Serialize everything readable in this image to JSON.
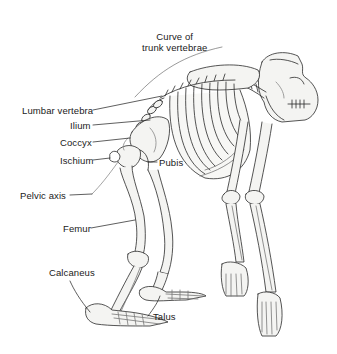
{
  "figure": {
    "colors": {
      "background": "#ffffff",
      "line": "#2a2a2a",
      "bone_fill": "#f4f4f2",
      "shade": "#9a9a9a"
    }
  },
  "labels": {
    "curve": {
      "line1": "Curve of",
      "line2": "trunk vertebrae"
    },
    "lumbar_vertebra": "Lumbar vertebra",
    "ilium": "Ilium",
    "coccyx": "Coccyx",
    "ischium": "Ischium",
    "pubis": "Pubis",
    "pelvic_axis": "Pelvic axis",
    "femur": "Femur",
    "calcaneus": "Calcaneus",
    "talus": "Talus"
  }
}
